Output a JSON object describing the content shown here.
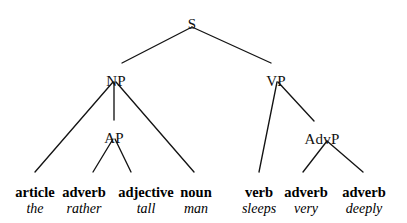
{
  "diagram": {
    "type": "syntax-tree",
    "sentence": "the rather tall man sleeps very deeply",
    "line_color": "#141414",
    "background_color": "#ffffff",
    "text_color": "#000000"
  },
  "nodes": {
    "s": {
      "label": "S",
      "x": 192,
      "y": 17
    },
    "np": {
      "label": "NP",
      "x": 116,
      "y": 74
    },
    "vp": {
      "label": "VP",
      "x": 276,
      "y": 74
    },
    "ap": {
      "label": "AP",
      "x": 114,
      "y": 131
    },
    "advp": {
      "label": "AdvP",
      "x": 322,
      "y": 132
    }
  },
  "leaves": [
    {
      "category": "article",
      "word": "the",
      "x": 35,
      "cat_y": 185,
      "word_y": 202
    },
    {
      "category": "adverb",
      "word": "rather",
      "x": 84,
      "cat_y": 185,
      "word_y": 202
    },
    {
      "category": "adjective",
      "word": "tall",
      "x": 146,
      "cat_y": 185,
      "word_y": 202
    },
    {
      "category": "noun",
      "word": "man",
      "x": 196,
      "cat_y": 185,
      "word_y": 202
    },
    {
      "category": "verb",
      "word": "sleeps",
      "x": 259,
      "cat_y": 185,
      "word_y": 202
    },
    {
      "category": "adverb",
      "word": "very",
      "x": 306,
      "cat_y": 185,
      "word_y": 202
    },
    {
      "category": "adverb",
      "word": "deeply",
      "x": 364,
      "cat_y": 185,
      "word_y": 202
    }
  ],
  "edges": [
    {
      "from": "S",
      "to": "NP",
      "x1": 192,
      "y1": 27,
      "x2": 122,
      "y2": 63
    },
    {
      "from": "S",
      "to": "VP",
      "x1": 192,
      "y1": 27,
      "x2": 271,
      "y2": 63
    },
    {
      "from": "NP",
      "to": "article",
      "x1": 113,
      "y1": 82,
      "x2": 35,
      "y2": 172
    },
    {
      "from": "NP",
      "to": "AP",
      "x1": 114,
      "y1": 82,
      "x2": 114,
      "y2": 120
    },
    {
      "from": "NP",
      "to": "noun",
      "x1": 116,
      "y1": 82,
      "x2": 194,
      "y2": 172
    },
    {
      "from": "AP",
      "to": "adverb1",
      "x1": 113,
      "y1": 139,
      "x2": 93,
      "y2": 172
    },
    {
      "from": "AP",
      "to": "adjective",
      "x1": 115,
      "y1": 139,
      "x2": 131,
      "y2": 172
    },
    {
      "from": "VP",
      "to": "verb",
      "x1": 277,
      "y1": 82,
      "x2": 259,
      "y2": 172
    },
    {
      "from": "VP",
      "to": "AdvP",
      "x1": 278,
      "y1": 82,
      "x2": 314,
      "y2": 121
    },
    {
      "from": "AdvP",
      "to": "adverb2",
      "x1": 327,
      "y1": 141,
      "x2": 303,
      "y2": 172
    },
    {
      "from": "AdvP",
      "to": "adverb3",
      "x1": 327,
      "y1": 141,
      "x2": 363,
      "y2": 172
    }
  ]
}
